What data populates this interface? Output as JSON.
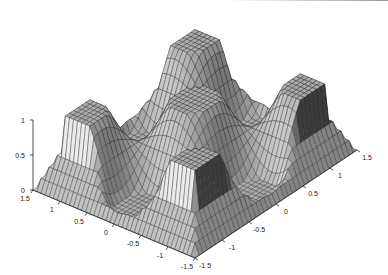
{
  "chart_data": {
    "type": "surface",
    "title": "",
    "xlabel": "",
    "ylabel": "",
    "zlabel": "",
    "xlim": [
      -1.5,
      1.5
    ],
    "ylim": [
      -1.5,
      1.5
    ],
    "zlim": [
      0,
      1
    ],
    "x_ticks": [
      "-1.5",
      "-1",
      "-0.5",
      "0",
      "0.5",
      "1",
      "1.5"
    ],
    "y_ticks": [
      "-1.5",
      "-1",
      "-0.5",
      "0",
      "0.5",
      "1",
      "1.5"
    ],
    "z_ticks": [
      "0",
      "0.5",
      "1"
    ],
    "grid": false,
    "colormap": "gray",
    "edge_color": "#222222",
    "surface_model": {
      "grid_n": 40,
      "frequency": 3.0,
      "clip": [
        0,
        1
      ],
      "outer_zero_radius": 1.5
    }
  },
  "axes": {
    "z_axis": {
      "ticks": [
        {
          "label": "1",
          "value": 1
        },
        {
          "label": "0.5",
          "value": 0.5
        },
        {
          "label": "0",
          "value": 0
        }
      ]
    },
    "left_axis": {
      "ticks": [
        {
          "label": "1.5",
          "value": 1.5
        },
        {
          "label": "1",
          "value": 1
        },
        {
          "label": "0.5",
          "value": 0.5
        },
        {
          "label": "0",
          "value": 0
        },
        {
          "label": "-0.5",
          "value": -0.5
        },
        {
          "label": "-1",
          "value": -1
        },
        {
          "label": "-1.5",
          "value": -1.5
        }
      ]
    },
    "right_axis": {
      "ticks": [
        {
          "label": "-1.5",
          "value": -1.5
        },
        {
          "label": "-1",
          "value": -1
        },
        {
          "label": "-0.5",
          "value": -0.5
        },
        {
          "label": "0",
          "value": 0
        },
        {
          "label": "0.5",
          "value": 0.5
        },
        {
          "label": "1",
          "value": 1
        },
        {
          "label": "1.5",
          "value": 1.5
        }
      ]
    }
  }
}
